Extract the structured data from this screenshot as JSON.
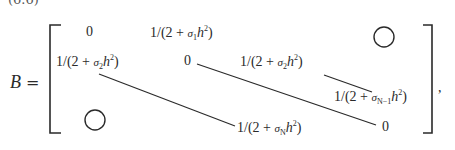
{
  "equation_number": "(6.6)",
  "lhs": {
    "symbol": "B",
    "operator": "="
  },
  "matrix": {
    "row1": {
      "diag": "0",
      "super": {
        "prefix": "1/(2 + ",
        "sigma": "σ",
        "sub": "1",
        "h": "h",
        "sup": "2",
        "suffix": ")"
      },
      "zero_block": "circle"
    },
    "row2": {
      "sub": {
        "prefix": "1/(2 + ",
        "sigma": "σ",
        "sub": "2",
        "h": "h",
        "sup": "2",
        "suffix": ")"
      },
      "diag": "0",
      "super": {
        "prefix": "1/(2 + ",
        "sigma": "σ",
        "sub": "2",
        "h": "h",
        "sup": "2",
        "suffix": ")"
      }
    },
    "row3": {
      "super": {
        "prefix": "1/(2 + ",
        "sigma": "σ",
        "sub": "N−1",
        "h": "h",
        "sup": "2",
        "suffix": ")"
      }
    },
    "row4": {
      "zero_block": "circle",
      "sub": {
        "prefix": "1/(2 + ",
        "sigma": "σ",
        "sub": "N",
        "h": "h",
        "sup": "2",
        "suffix": ")"
      },
      "diag": "0"
    }
  },
  "trailing_punctuation": ","
}
